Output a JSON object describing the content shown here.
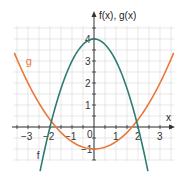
{
  "chart_data": {
    "type": "line",
    "title": "",
    "xlabel": "x",
    "ylabel": "f(x), g(x)",
    "xlim": [
      -3.7,
      3.7
    ],
    "ylim": [
      -1.6,
      4.7
    ],
    "grid": true,
    "grid_step": 0.5,
    "x_ticks": [
      -3,
      -2,
      -1,
      0,
      1,
      2,
      3
    ],
    "x_tick_labels": [
      "−3",
      "−2",
      "−1",
      "0",
      "1",
      "2",
      "3"
    ],
    "y_ticks": [
      -1,
      1,
      2,
      3,
      4
    ],
    "y_tick_labels": [
      "−1",
      "1",
      "2",
      "3",
      "4"
    ],
    "series": [
      {
        "name": "f",
        "label": "f",
        "color": "#2f7d72",
        "formula": "f(x) = -x^2 + 4",
        "x": [
          -2.4,
          -2,
          -1.5,
          -1,
          -0.5,
          0,
          0.5,
          1,
          1.5,
          2,
          2.4
        ],
        "y": [
          -1.76,
          0,
          1.75,
          3,
          3.75,
          4,
          3.75,
          3,
          1.75,
          0,
          -1.76
        ]
      },
      {
        "name": "g",
        "label": "g",
        "color": "#e8783a",
        "formula": "g(x) = x^2/3 - 1",
        "x": [
          -3.6,
          -3,
          -2,
          -1,
          0,
          1,
          2,
          3,
          3.6
        ],
        "y": [
          3.32,
          2,
          0.33,
          -0.67,
          -1,
          -0.67,
          0.33,
          2,
          3.32
        ]
      }
    ],
    "annotations": [
      {
        "text": "g",
        "x": -3.1,
        "y": 2.8
      },
      {
        "text": "f",
        "x": -2.6,
        "y": -1.45
      }
    ]
  },
  "labels": {
    "y_axis_title": "f(x), g(x)",
    "x_axis_title": "x",
    "origin": "0",
    "g_label": "g",
    "f_label": "f"
  }
}
